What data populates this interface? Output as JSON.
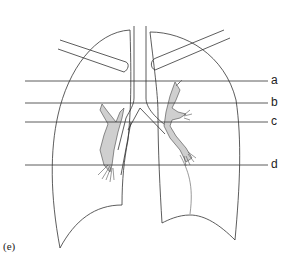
{
  "diagram": {
    "panel_label": "(e)",
    "level_lines": [
      {
        "label": "a",
        "y": 81
      },
      {
        "label": "b",
        "y": 103
      },
      {
        "label": "c",
        "y": 122
      },
      {
        "label": "d",
        "y": 165
      }
    ],
    "colors": {
      "line": "#333333",
      "bronchi_fill": "#cfcfcf",
      "background": "#ffffff"
    }
  }
}
